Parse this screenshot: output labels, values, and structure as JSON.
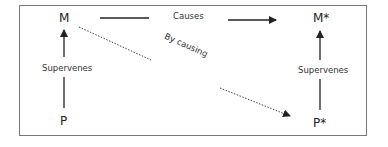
{
  "diagram": {
    "nodes": {
      "m": "M",
      "m_star": "M*",
      "p": "P",
      "p_star": "P*"
    },
    "edges": {
      "causes": "Causes",
      "by_causing": "By causing",
      "supervenes_left": "Supervenes",
      "supervenes_right": "Supervenes"
    },
    "colors": {
      "line": "#222222",
      "frame": "#777777"
    }
  }
}
